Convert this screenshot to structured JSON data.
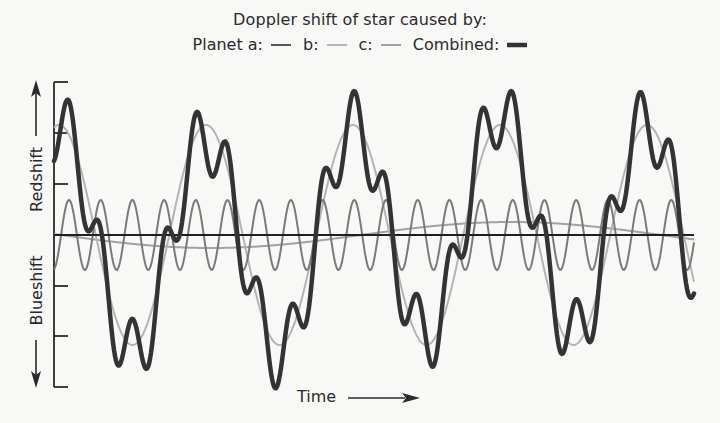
{
  "title": "Doppler shift of star caused by:",
  "legend": {
    "planet_a_label": "Planet a:",
    "b_label": "b:",
    "c_label": "c:",
    "combined_label": "Combined:"
  },
  "axes": {
    "y_upper_label": "Redshift",
    "y_lower_label": "Blueshift",
    "x_label": "Time"
  },
  "colors": {
    "planet_a": "#7a7a7a",
    "planet_b": "#b4b4b4",
    "planet_c": "#a2a2a2",
    "combined": "#333333",
    "axis": "#2a2a2a",
    "background": "#f8f8f6"
  },
  "chart_data": {
    "type": "line",
    "title": "Doppler shift of star caused by:",
    "xlabel": "Time",
    "ylabel_positive": "Redshift",
    "ylabel_negative": "Blueshift",
    "tick_labels": [],
    "y_ticks_count": 7,
    "grid": false,
    "legend_position": "top",
    "units": "arbitrary (pixel-scaled); x from 0 to 640, y from -150 to 150",
    "series": [
      {
        "name": "Planet a",
        "kind": "sine",
        "amplitude": 35,
        "period": 31.7,
        "peak_x": 15,
        "color": "#7a7a7a",
        "width": 2
      },
      {
        "name": "b",
        "kind": "sine",
        "amplitude": 110,
        "period": 147,
        "peak_x": 5,
        "color": "#b4b4b4",
        "width": 2
      },
      {
        "name": "c",
        "kind": "sine",
        "amplitude": 13,
        "period": 600,
        "peak_x": 457,
        "color": "#a2a2a2",
        "width": 2
      },
      {
        "name": "Combined",
        "kind": "sum",
        "color": "#333333",
        "width": 4.5
      }
    ],
    "x_range": [
      0,
      640
    ],
    "y_range": [
      -152,
      152
    ]
  }
}
